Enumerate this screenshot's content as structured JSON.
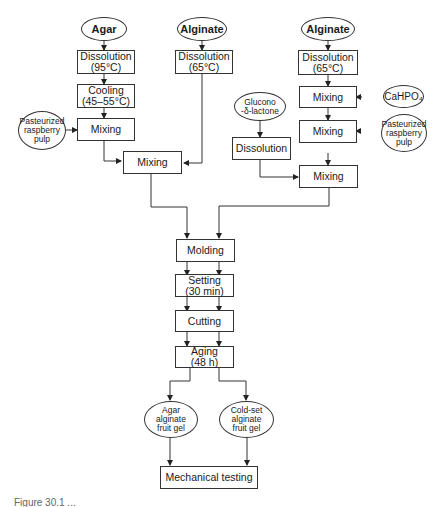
{
  "diagram": {
    "type": "flowchart",
    "nodes": {
      "agar": {
        "label": "Agar",
        "shape": "ellipse"
      },
      "alginate1": {
        "label": "Alginate",
        "shape": "ellipse"
      },
      "alginate2": {
        "label": "Alginate",
        "shape": "ellipse"
      },
      "diss_agar": {
        "label": "Dissolution\n(95°C)",
        "shape": "box"
      },
      "diss_alg1": {
        "label": "Dissolution\n(65°C)",
        "shape": "box"
      },
      "diss_alg2": {
        "label": "Dissolution\n(65°C)",
        "shape": "box"
      },
      "cooling": {
        "label": "Cooling\n(45–55°C)",
        "shape": "box"
      },
      "pulp1": {
        "label": "Pasteurized\nraspberry\npulp",
        "shape": "ellipse"
      },
      "mixing_a1": {
        "label": "Mixing",
        "shape": "box"
      },
      "mixing_a2": {
        "label": "Mixing",
        "shape": "box"
      },
      "gdl": {
        "label": "Glucono\n-δ-lactone",
        "shape": "ellipse"
      },
      "diss_gdl": {
        "label": "Dissolution",
        "shape": "box"
      },
      "cahpo4": {
        "label": "CaHPO₄",
        "shape": "ellipse"
      },
      "mixing_b1": {
        "label": "Mixing",
        "shape": "box"
      },
      "mixing_b2": {
        "label": "Mixing",
        "shape": "box"
      },
      "pulp2": {
        "label": "Pasteurized\nraspberry\npulp",
        "shape": "ellipse"
      },
      "mixing_b3": {
        "label": "Mixing",
        "shape": "box"
      },
      "molding": {
        "label": "Molding",
        "shape": "box"
      },
      "setting": {
        "label": "Setting\n(30 min)",
        "shape": "box"
      },
      "cutting": {
        "label": "Cutting",
        "shape": "box"
      },
      "aging": {
        "label": "Aging\n(48 h)",
        "shape": "box"
      },
      "gel_agar": {
        "label": "Agar\nalginate\nfruit gel",
        "shape": "ellipse"
      },
      "gel_cold": {
        "label": "Cold-set\nalginate\nfruit gel",
        "shape": "ellipse"
      },
      "testing": {
        "label": "Mechanical testing",
        "shape": "box"
      }
    },
    "edges": [
      [
        "agar",
        "diss_agar"
      ],
      [
        "diss_agar",
        "cooling"
      ],
      [
        "cooling",
        "mixing_a1"
      ],
      [
        "pulp1",
        "mixing_a1"
      ],
      [
        "mixing_a1",
        "mixing_a2"
      ],
      [
        "alginate1",
        "diss_alg1"
      ],
      [
        "diss_alg1",
        "mixing_a2"
      ],
      [
        "alginate2",
        "diss_alg2"
      ],
      [
        "diss_alg2",
        "mixing_b1"
      ],
      [
        "cahpo4",
        "mixing_b1"
      ],
      [
        "mixing_b1",
        "mixing_b2"
      ],
      [
        "pulp2",
        "mixing_b2"
      ],
      [
        "gdl",
        "diss_gdl"
      ],
      [
        "diss_gdl",
        "mixing_b3"
      ],
      [
        "mixing_b2",
        "mixing_b3"
      ],
      [
        "mixing_a2",
        "molding"
      ],
      [
        "mixing_b3",
        "molding"
      ],
      [
        "molding",
        "setting"
      ],
      [
        "setting",
        "cutting"
      ],
      [
        "cutting",
        "aging"
      ],
      [
        "aging",
        "gel_agar"
      ],
      [
        "aging",
        "gel_cold"
      ],
      [
        "gel_agar",
        "testing"
      ],
      [
        "gel_cold",
        "testing"
      ]
    ]
  },
  "caption": {
    "text": "Figure 30.1 ..."
  }
}
